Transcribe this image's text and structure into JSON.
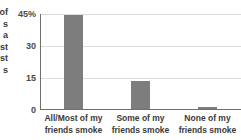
{
  "caption_fragment": {
    "lines": [
      "of",
      "s",
      "a",
      "st",
      "st",
      "s"
    ]
  },
  "chart_data": {
    "type": "bar",
    "title": "",
    "subtitle": "",
    "xlabel": "",
    "ylabel": "",
    "categories": [
      "All/Most of my\nfriends smoke",
      "Some of my\nfriends smoke",
      "None of my\nfriends smoke"
    ],
    "category_lines": [
      [
        "All/Most of my",
        "friends smoke"
      ],
      [
        "Some of my",
        "friends smoke"
      ],
      [
        "None of my",
        "friends smoke"
      ]
    ],
    "values": [
      44,
      13,
      1
    ],
    "ylim": [
      0,
      45
    ],
    "yticks": [
      0,
      15,
      30,
      45
    ],
    "ytick_labels": [
      "0",
      "15",
      "30",
      "45%"
    ],
    "grid": true,
    "legend": "none",
    "bar_color": "#7d7d7d",
    "grid_color": "#dcdcdc",
    "axis_color": "#6f6f6f",
    "text_color": "#3a3a3a"
  }
}
